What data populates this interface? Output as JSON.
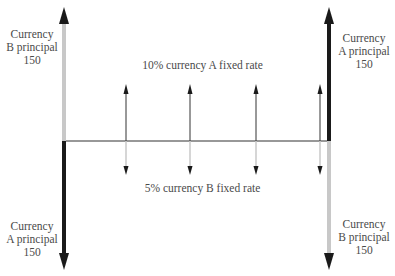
{
  "diagram": {
    "labels": {
      "top_left": {
        "line1": "Currency",
        "line2": "B principal",
        "line3": "150"
      },
      "top_right": {
        "line1": "Currency",
        "line2": "A principal",
        "line3": "150"
      },
      "bottom_left": {
        "line1": "Currency",
        "line2": "A principal",
        "line3": "150"
      },
      "bottom_right": {
        "line1": "Currency",
        "line2": "B principal",
        "line3": "150"
      },
      "upper_rate": "10% currency A fixed rate",
      "lower_rate": "5% currency B fixed rate"
    },
    "colors": {
      "dark_arrow": "#1a1a1a",
      "light_arrow": "#c8c8c8",
      "axis": "#333333",
      "text": "#4a4a4a"
    },
    "interest_periods": 4
  }
}
